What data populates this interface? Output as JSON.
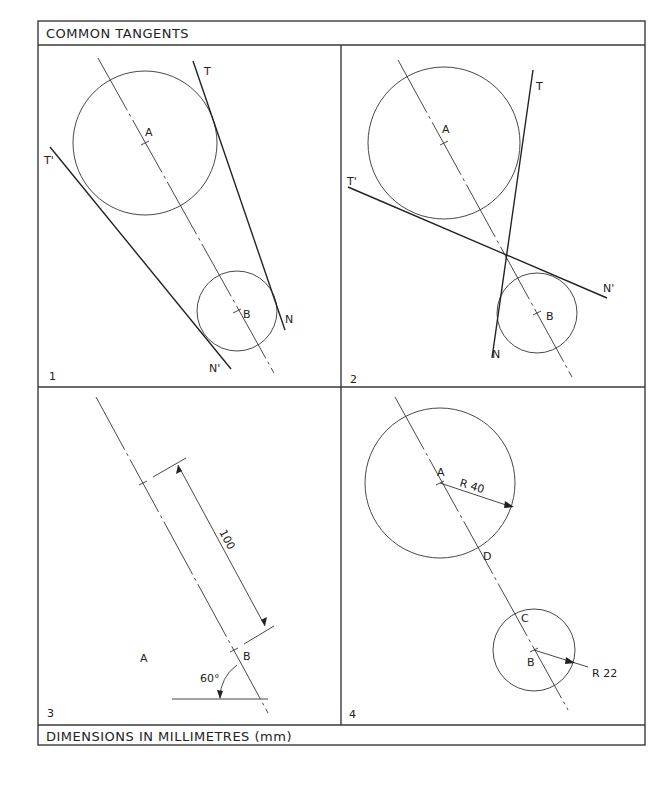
{
  "header": {
    "title": "COMMON TANGENTS"
  },
  "footer": {
    "note": "DIMENSIONS IN MILLIMETRES (mm)"
  },
  "panels": [
    {
      "number": "1",
      "description": "Exterior common tangents to two circles",
      "labels": {
        "center_a": "A",
        "center_b": "B",
        "tangent_t": "T",
        "tangent_t_prime": "T'",
        "point_n": "N",
        "point_n_prime": "N'"
      }
    },
    {
      "number": "2",
      "description": "Interior (crossed) common tangents to two circles",
      "labels": {
        "center_a": "A",
        "center_b": "B",
        "tangent_t": "T",
        "tangent_t_prime": "T'",
        "point_n": "N",
        "point_n_prime": "N'"
      }
    },
    {
      "number": "3",
      "description": "Centre line AB set out at 60 degrees, length 100",
      "labels": {
        "center_a": "A",
        "center_b": "B",
        "distance": "100",
        "angle": "60°"
      }
    },
    {
      "number": "4",
      "description": "Circles of radius 40 and 22 drawn on centres A and B",
      "labels": {
        "center_a": "A",
        "center_b": "B",
        "point_c": "C",
        "point_d": "D",
        "radius_a": "R 40",
        "radius_b": "R 22"
      }
    }
  ],
  "colors": {
    "ink": "#222222",
    "paper": "#ffffff"
  }
}
